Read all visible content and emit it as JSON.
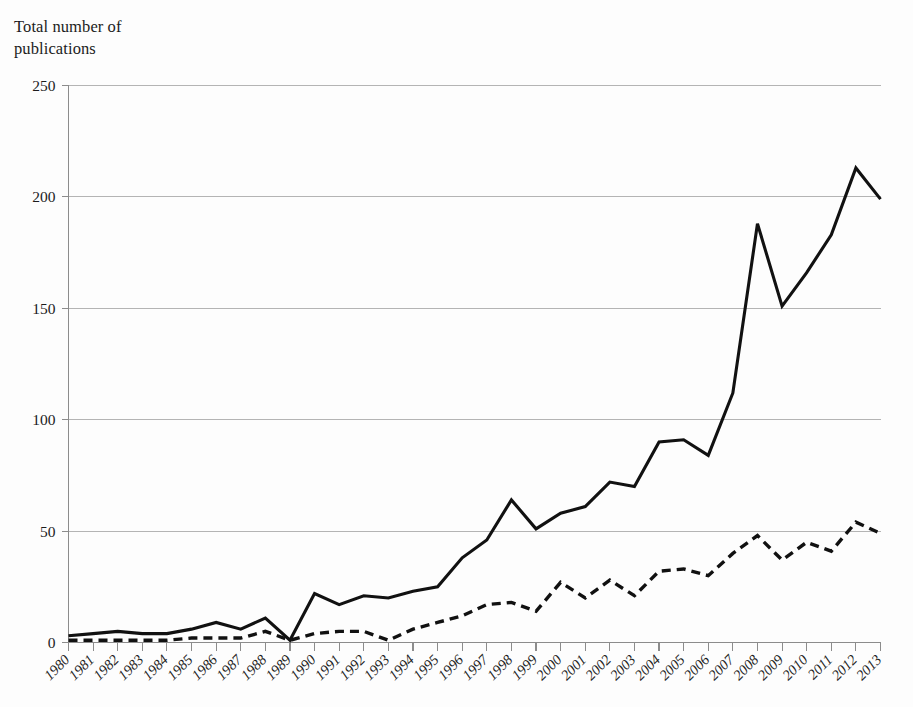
{
  "figure": {
    "axis_title": "Total number of\npublications",
    "background_color": "#fdfdfd",
    "line_color": "#111111",
    "grid_color": "#b4b4b4"
  },
  "chart_data": {
    "type": "line",
    "title": "",
    "subtitle": "",
    "xlabel": "",
    "ylabel": "Total number of publications",
    "ylim": [
      0,
      250
    ],
    "yticks": [
      0,
      50,
      100,
      150,
      200,
      250
    ],
    "grid": true,
    "grid_axis": "y",
    "legend": false,
    "legend_position": "none",
    "x": [
      "1980",
      "1981",
      "1982",
      "1983",
      "1984",
      "1985",
      "1986",
      "1987",
      "1988",
      "1989",
      "1990",
      "1991",
      "1992",
      "1993",
      "1994",
      "1995",
      "1996",
      "1997",
      "1998",
      "1999",
      "2000",
      "2001",
      "2002",
      "2003",
      "2004",
      "2005",
      "2006",
      "2007",
      "2008",
      "2009",
      "2010",
      "2011",
      "2012",
      "2013"
    ],
    "series": [
      {
        "name": "solid-series",
        "style": "solid",
        "values": [
          3,
          4,
          5,
          4,
          4,
          6,
          9,
          6,
          11,
          1,
          22,
          17,
          21,
          20,
          23,
          25,
          38,
          46,
          64,
          51,
          58,
          61,
          72,
          70,
          90,
          91,
          84,
          112,
          188,
          151,
          166,
          183,
          213,
          199
        ]
      },
      {
        "name": "dashed-series",
        "style": "dashed",
        "values": [
          1,
          1,
          1,
          1,
          1,
          2,
          2,
          2,
          5,
          1,
          4,
          5,
          5,
          1,
          6,
          9,
          12,
          17,
          18,
          14,
          27,
          20,
          28,
          21,
          32,
          33,
          30,
          40,
          48,
          37,
          45,
          41,
          54,
          49
        ]
      }
    ],
    "axis_ranges": {
      "x_first": "1980",
      "x_last": "2013",
      "y_min": 0,
      "y_max": 250
    }
  }
}
